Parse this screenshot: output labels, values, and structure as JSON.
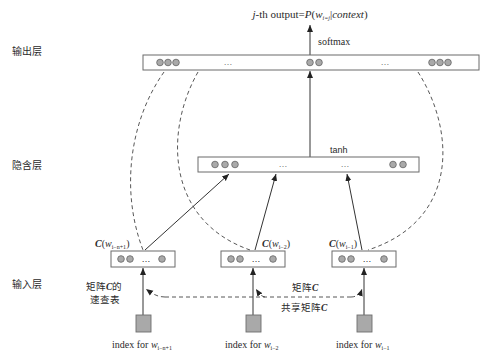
{
  "diagram": {
    "title": {
      "prefix_italic": "j",
      "prefix": "-th output=",
      "func": "P",
      "open": "(",
      "var": "w",
      "sub": "i=j",
      "bar": "|",
      "context": "context",
      "close": ")"
    },
    "layers": {
      "output": "输出层",
      "hidden": "隐含层",
      "input": "输入层"
    },
    "activations": {
      "output": "softmax",
      "hidden": "tanh"
    },
    "ellipsis": "…",
    "embeddings": [
      {
        "label_C": "C",
        "open": "(",
        "var": "w",
        "sub": "i−n+1",
        "close": ")"
      },
      {
        "label_C": "C",
        "open": "(",
        "var": "w",
        "sub": "i−2",
        "close": ")"
      },
      {
        "label_C": "C",
        "open": "(",
        "var": "w",
        "sub": "i−1",
        "close": ")"
      }
    ],
    "lookup_table": {
      "line1_prefix": "矩阵",
      "line1_C": "C",
      "line1_suffix": "的",
      "line2": "速查表"
    },
    "matrix_label": {
      "prefix": "矩阵",
      "C": "C"
    },
    "shared_label": {
      "prefix": "共享矩阵",
      "C": "C"
    },
    "indices": [
      {
        "prefix": "index for ",
        "var": "w",
        "sub": "i−n+1"
      },
      {
        "prefix": "index for ",
        "var": "w",
        "sub": "i−2"
      },
      {
        "prefix": "index for ",
        "var": "w",
        "sub": "i−1"
      }
    ],
    "colors": {
      "node_fill": "#a9a9a9",
      "node_stroke": "#6e6e6e",
      "line": "#333333",
      "box_stroke": "#6b6b6b"
    }
  }
}
